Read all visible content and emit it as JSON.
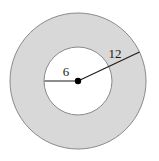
{
  "figure": {
    "type": "annulus-diagram",
    "background_color": "#ffffff",
    "shading_color": "#d8d8d8",
    "stroke_color": "#808080",
    "line_color": "#1a1a1a",
    "dot_color": "#000000",
    "outer_circle": {
      "name": "outer-circle",
      "center_x": 78,
      "center_y": 81,
      "radius": 68,
      "fill": "#d8d8d8",
      "stroke": "#8a8a8a",
      "stroke_width": 1
    },
    "inner_circle": {
      "name": "inner-circle",
      "center_x": 78,
      "center_y": 81,
      "radius": 34,
      "fill": "#ffffff",
      "stroke": "#8a8a8a",
      "stroke_width": 1
    },
    "center_dot": {
      "name": "center-point",
      "cx": 78,
      "cy": 81,
      "r": 3.2
    },
    "radius_segments": [
      {
        "name": "inner-radius-segment",
        "label": "6",
        "x1": 78,
        "y1": 81,
        "x2": 44.5,
        "y2": 81,
        "label_x": 66,
        "label_y": 76
      },
      {
        "name": "outer-radius-segment",
        "label": "12",
        "x1": 78,
        "y1": 81,
        "x2": 139.5,
        "y2": 52,
        "label_x": 115,
        "label_y": 58
      }
    ]
  }
}
